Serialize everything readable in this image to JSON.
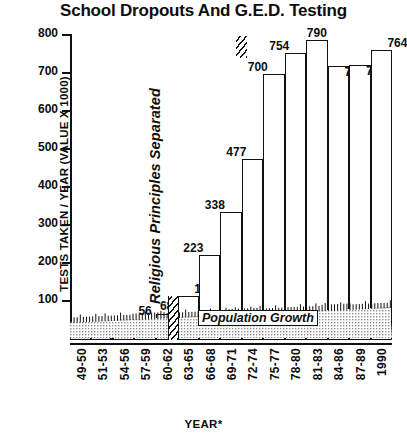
{
  "title": "School Dropouts And G.E.D. Testing",
  "annotations": {
    "separator": "Religious Principles Separated",
    "population": "Population Growth"
  },
  "chart_data": {
    "type": "bar",
    "title": "School Dropouts And G.E.D. Testing",
    "xlabel": "YEAR*",
    "ylabel": "TESTS TAKEN / YEAR (VALUE X 1000)",
    "ylim": [
      0,
      800
    ],
    "yticks": [
      100,
      200,
      300,
      400,
      500,
      600,
      700,
      800
    ],
    "grid": false,
    "legend": false,
    "categories": [
      "49-50",
      "51-53",
      "54-56",
      "57-59",
      "60-62",
      "63-65",
      "66-68",
      "69-71",
      "72-74",
      "75-77",
      "78-80",
      "81-83",
      "84-86",
      "87-89",
      "1990"
    ],
    "values": [
      38,
      29,
      46,
      56,
      68,
      116,
      223,
      338,
      477,
      700,
      754,
      790,
      720,
      725,
      764
    ],
    "annotations": [
      {
        "text": "Religious Principles Separated",
        "between": [
          "60-62",
          "63-65"
        ]
      },
      {
        "text": "Population Growth",
        "series": "shaded baseline band"
      }
    ]
  },
  "axis": {
    "y_title": "TESTS TAKEN / YEAR (VALUE X 1000)",
    "x_title": "YEAR*",
    "y_ticks": [
      "800",
      "700",
      "600",
      "500",
      "400",
      "300",
      "200",
      "100"
    ],
    "x_ticks": [
      "49-50",
      "51-53",
      "54-56",
      "57-59",
      "60-62",
      "63-65",
      "66-68",
      "69-71",
      "72-74",
      "75-77",
      "78-80",
      "81-83",
      "84-86",
      "87-89",
      "1990"
    ]
  },
  "bar_labels": [
    "38",
    "29",
    "46",
    "56",
    "68",
    "116",
    "223",
    "338",
    "477",
    "700",
    "754",
    "790",
    "720",
    "725",
    "764"
  ]
}
